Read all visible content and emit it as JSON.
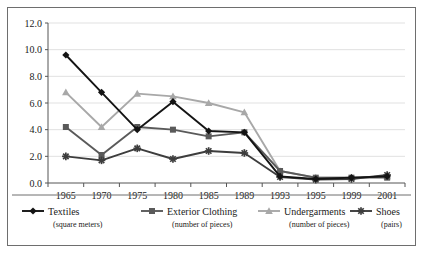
{
  "chart_data": {
    "type": "line",
    "title": "",
    "subtitle": "",
    "xlabel": "",
    "ylabel": "",
    "grid": true,
    "legend_position": "bottom",
    "categories": [
      "1965",
      "1970",
      "1975",
      "1980",
      "1985",
      "1989",
      "1993",
      "1995",
      "1999",
      "2001"
    ],
    "x": [
      1965,
      1970,
      1975,
      1980,
      1985,
      1989,
      1993,
      1995,
      1999,
      2001
    ],
    "ylim": [
      0.0,
      12.0
    ],
    "ytick_labels": [
      "0.0",
      "2.0",
      "4.0",
      "6.0",
      "8.0",
      "10.0",
      "12.0"
    ],
    "ytick_values": [
      0.0,
      2.0,
      4.0,
      6.0,
      8.0,
      10.0,
      12.0
    ],
    "series": [
      {
        "name": "Textiles",
        "unit": "(square meters)",
        "marker": "diamond",
        "color": "#141414",
        "values": [
          9.6,
          6.8,
          4.0,
          6.1,
          3.9,
          3.8,
          0.5,
          0.3,
          0.4,
          0.5
        ]
      },
      {
        "name": "Exterior Clothing",
        "unit": "(number of pieces)",
        "marker": "square",
        "color": "#5a5a5a",
        "values": [
          4.2,
          2.1,
          4.2,
          4.0,
          3.5,
          3.8,
          0.9,
          0.4,
          0.4,
          0.4
        ]
      },
      {
        "name": "Undergarments",
        "unit": "(number of pieces)",
        "marker": "triangle",
        "color": "#a8a8a8",
        "values": [
          6.8,
          4.2,
          6.7,
          6.5,
          6.0,
          5.3,
          0.9,
          0.4,
          0.4,
          0.5
        ]
      },
      {
        "name": "Shoes",
        "unit": "(pairs)",
        "marker": "star",
        "color": "#3d3d3d",
        "values": [
          2.0,
          1.7,
          2.6,
          1.8,
          2.4,
          2.25,
          0.45,
          0.25,
          0.3,
          0.6
        ]
      }
    ]
  }
}
